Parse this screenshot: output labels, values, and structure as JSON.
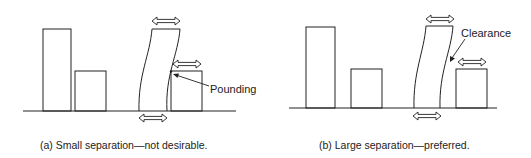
{
  "figure": {
    "panels": [
      {
        "id": "a",
        "caption": "(a)  Small separation—not desirable.",
        "annotation": "Pounding",
        "buildings": [
          "tall-building",
          "short-building",
          "swaying-tower",
          "adjacent-low-building"
        ],
        "motion_arrows": [
          "tower-top",
          "adjacent-top",
          "ground"
        ]
      },
      {
        "id": "b",
        "caption": "(b)  Large separation—preferred.",
        "annotation": "Clearance",
        "buildings": [
          "tall-building",
          "short-building",
          "swaying-tower",
          "adjacent-low-building"
        ],
        "motion_arrows": [
          "tower-top",
          "adjacent-top",
          "ground"
        ]
      }
    ],
    "colors": {
      "line": "#222222",
      "background": "#ffffff"
    }
  }
}
